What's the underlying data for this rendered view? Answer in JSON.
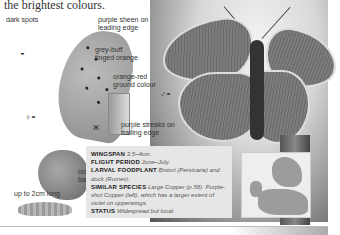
{
  "intro_text": "the brightest colours.",
  "top_cutoff_text": "…",
  "labels": {
    "dark_spots": "dark spots",
    "purple_sheen": "purple sheen on leading edge",
    "grey_buff": "grey-buff tinged orange",
    "orange_red": "orange-red ground colour",
    "purple_streaks": "purple streaks on trailing edge",
    "orange_band": "orange band",
    "larva_length": "up to 2cm long"
  },
  "symbols": {
    "underside_symbol": "◒",
    "male_female": "♂◓",
    "female_symbols": "♀◓",
    "mini_butterfly": "ж"
  },
  "info_box": {
    "wingspan_label": "WINGSPAN",
    "wingspan_value": "3.5–4cm.",
    "flight_label": "FLIGHT PERIOD",
    "flight_value": "June–July.",
    "foodplant_label": "LARVAL FOODPLANT",
    "foodplant_value": "Bistort (Persicaria) and dock (Rumex).",
    "similar_label": "SIMILAR SPECIES",
    "similar_value": "Large Copper (p.58). Purple-shot Copper (left), which has a larger extent of violet on upperwings.",
    "status_label": "STATUS",
    "status_value": "Widespread but local."
  },
  "map": {
    "region": "Europe distribution map"
  }
}
